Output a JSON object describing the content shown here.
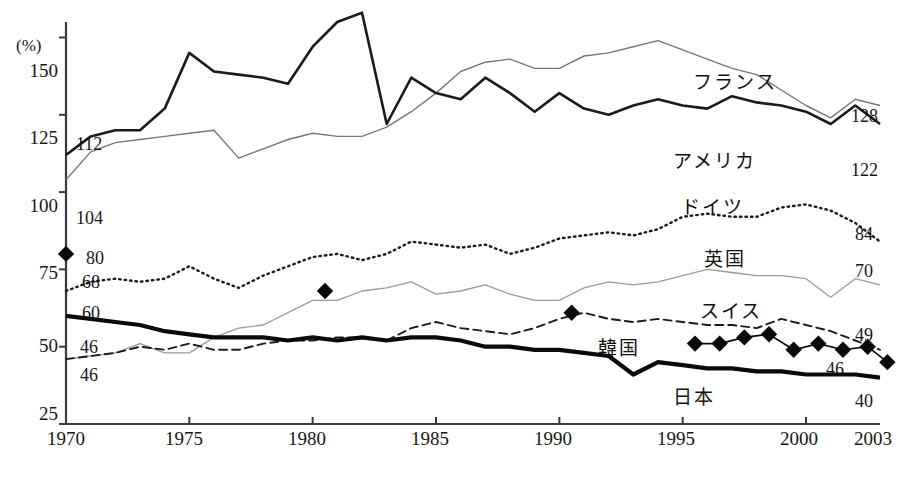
{
  "chart_data": {
    "type": "line",
    "title": "",
    "subtitle": "",
    "xlabel": "",
    "ylabel": "(%)",
    "unit_label": "(%)",
    "xlim": [
      1970,
      2003
    ],
    "ylim": [
      25,
      155
    ],
    "grid": false,
    "legend_position": "inline-annotations",
    "y_ticks": [
      25,
      50,
      75,
      100,
      125,
      150
    ],
    "x_ticks": [
      1970,
      1975,
      1980,
      1985,
      1990,
      1995,
      2000,
      2003
    ],
    "x_tick_labels": [
      "1970",
      "1975",
      "1980",
      "1985",
      "1990",
      "1995",
      "2000",
      "2003"
    ],
    "y_tick_labels": [
      "25",
      "50",
      "75",
      "100",
      "125",
      "150"
    ],
    "x": [
      1970,
      1971,
      1972,
      1973,
      1974,
      1975,
      1976,
      1977,
      1978,
      1979,
      1980,
      1981,
      1982,
      1983,
      1984,
      1985,
      1986,
      1987,
      1988,
      1989,
      1990,
      1991,
      1992,
      1993,
      1994,
      1995,
      1996,
      1997,
      1998,
      1999,
      2000,
      2001,
      2002,
      2003
    ],
    "series": [
      {
        "name": "france",
        "label": "フランス",
        "style": "thin-solid",
        "color": "#777777",
        "start_value": 104,
        "end_value": 128,
        "start_label": "104",
        "end_label": "128",
        "values": [
          104,
          113,
          116,
          117,
          118,
          119,
          120,
          111,
          114,
          117,
          119,
          118,
          118,
          121,
          126,
          132,
          139,
          142,
          143,
          140,
          140,
          144,
          145,
          147,
          149,
          146,
          143,
          140,
          138,
          133,
          128,
          124,
          130,
          128
        ]
      },
      {
        "name": "usa",
        "label": "アメリカ",
        "style": "medium-solid",
        "color": "#1b1b1b",
        "start_value": 112,
        "end_value": 122,
        "start_label": "112",
        "end_label": "122",
        "values": [
          112,
          118,
          120,
          120,
          127,
          145,
          139,
          138,
          137,
          135,
          147,
          155,
          158,
          122,
          137,
          132,
          130,
          137,
          132,
          126,
          132,
          127,
          125,
          128,
          130,
          128,
          127,
          131,
          129,
          128,
          126,
          122,
          128,
          122
        ]
      },
      {
        "name": "germany",
        "label": "ドイツ",
        "style": "dotted",
        "color": "#1b1b1b",
        "start_value": 68,
        "end_value": 84,
        "start_label": "68",
        "end_label": "84",
        "values": [
          68,
          71,
          72,
          71,
          72,
          76,
          72,
          69,
          73,
          76,
          79,
          80,
          78,
          80,
          84,
          83,
          82,
          83,
          80,
          82,
          85,
          86,
          87,
          86,
          88,
          92,
          93,
          92,
          92,
          95,
          96,
          94,
          90,
          84
        ]
      },
      {
        "name": "uk",
        "label": "英国",
        "style": "thin-grey",
        "color": "#9a9a9a",
        "start_value": 46,
        "end_value": 70,
        "start_label": "46",
        "end_label": "70",
        "values": [
          46,
          47,
          48,
          51,
          48,
          48,
          53,
          56,
          57,
          61,
          65,
          65,
          68,
          69,
          71,
          67,
          68,
          70,
          67,
          65,
          65,
          69,
          71,
          70,
          71,
          73,
          75,
          74,
          73,
          73,
          72,
          66,
          72,
          70
        ]
      },
      {
        "name": "switzerland",
        "label": "スイス",
        "style": "dashed",
        "color": "#1b1b1b",
        "start_value": 46,
        "end_value": 49,
        "start_label": "46",
        "end_label": "49",
        "values": [
          46,
          47,
          48,
          50,
          49,
          51,
          49,
          49,
          51,
          52,
          52,
          53,
          53,
          52,
          56,
          58,
          56,
          55,
          54,
          56,
          59,
          61,
          59,
          58,
          59,
          58,
          57,
          57,
          56,
          59,
          57,
          55,
          52,
          49
        ]
      },
      {
        "name": "japan",
        "label": "日本",
        "style": "thick-solid",
        "color": "#0a0a0a",
        "start_value": 60,
        "end_value": 40,
        "start_label": "60",
        "end_label": "40",
        "values": [
          60,
          59,
          58,
          57,
          55,
          54,
          53,
          53,
          53,
          52,
          53,
          52,
          53,
          52,
          53,
          53,
          52,
          50,
          50,
          49,
          49,
          48,
          47,
          41,
          45,
          44,
          43,
          43,
          42,
          42,
          41,
          41,
          41,
          40
        ]
      },
      {
        "name": "korea",
        "label": "韓国",
        "style": "diamond-marker",
        "color": "#0a0a0a",
        "start_value": 80,
        "end_value": 46,
        "start_label": "80",
        "end_label": "46",
        "marker_points": [
          {
            "x": 1970,
            "y": 80,
            "connected": false
          },
          {
            "x": 1980.5,
            "y": 68,
            "connected": false
          },
          {
            "x": 1990.5,
            "y": 61,
            "connected": false
          },
          {
            "x": 1995.5,
            "y": 51,
            "connected": true
          },
          {
            "x": 1996.5,
            "y": 51,
            "connected": true
          },
          {
            "x": 1997.5,
            "y": 53,
            "connected": true
          },
          {
            "x": 1998.5,
            "y": 54,
            "connected": true
          },
          {
            "x": 1999.5,
            "y": 49,
            "connected": true
          },
          {
            "x": 2000.5,
            "y": 51,
            "connected": true
          },
          {
            "x": 2001.5,
            "y": 49,
            "connected": true
          },
          {
            "x": 2002.5,
            "y": 50,
            "connected": true
          },
          {
            "x": 2003.3,
            "y": 45,
            "connected": true
          }
        ]
      }
    ],
    "left_annotations": [
      {
        "text": "112",
        "series": "usa"
      },
      {
        "text": "104",
        "series": "france"
      },
      {
        "text": "80",
        "series": "korea"
      },
      {
        "text": "68",
        "series": "germany"
      },
      {
        "text": "60",
        "series": "japan"
      },
      {
        "text": "46",
        "series": "uk"
      },
      {
        "text": "46",
        "series": "switzerland"
      }
    ],
    "right_annotations": [
      {
        "text": "128",
        "series": "france"
      },
      {
        "text": "122",
        "series": "usa"
      },
      {
        "text": "84",
        "series": "germany"
      },
      {
        "text": "70",
        "series": "uk"
      },
      {
        "text": "49",
        "series": "switzerland"
      },
      {
        "text": "46",
        "series": "korea"
      },
      {
        "text": "40",
        "series": "japan"
      }
    ]
  },
  "axis": {
    "unit": "(%)",
    "y_labels": [
      "150",
      "125",
      "100",
      "75",
      "50",
      "25"
    ],
    "x_labels": [
      "1970",
      "1975",
      "1980",
      "1985",
      "1990",
      "1995",
      "2000",
      "2003"
    ]
  },
  "annotations": {
    "left": {
      "usa_112": "112",
      "france_104": "104",
      "korea_80": "80",
      "germany_68": "68",
      "japan_60": "60",
      "uk_46": "46",
      "switzerland_46": "46"
    },
    "right": {
      "france_128": "128",
      "usa_122": "122",
      "germany_84": "84",
      "uk_70": "70",
      "switzerland_49": "49",
      "korea_46": "46",
      "japan_40": "40"
    },
    "series_names": {
      "france": "フランス",
      "usa": "アメリカ",
      "germany": "ドイツ",
      "uk": "英国",
      "switzerland": "スイス",
      "korea": "韓国",
      "japan": "日本"
    }
  }
}
